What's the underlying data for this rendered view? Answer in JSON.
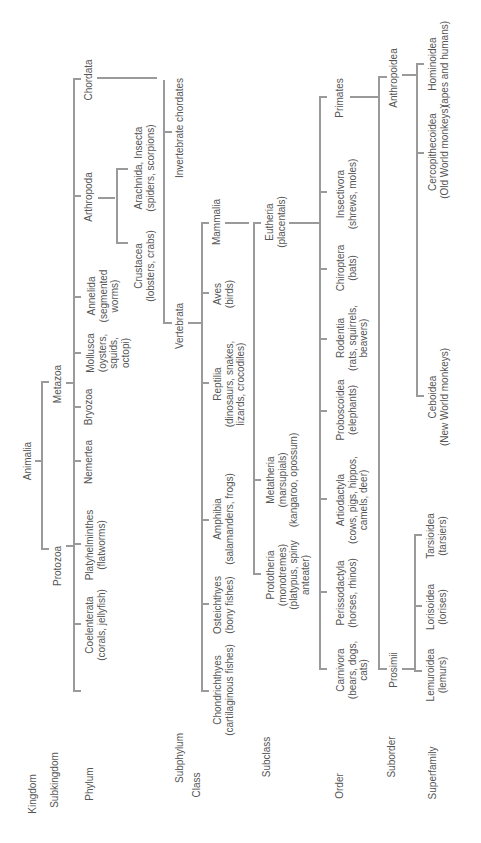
{
  "ranks": {
    "kingdom": "Kingdom",
    "subkingdom": "Subkingdom",
    "phylum": "Phylum",
    "subphylum": "Subphylum",
    "class": "Class",
    "subclass": "Subclass",
    "order": "Order",
    "suborder": "Suborder",
    "superfamily": "Superfamily"
  },
  "kingdom": {
    "name": "Animalia"
  },
  "subkingdoms": {
    "protozoa": "Protozoa",
    "metazoa": "Metazoa"
  },
  "phyla": {
    "coelenterata": {
      "name": "Coelenterata",
      "desc": "(corals, jellyfish)"
    },
    "platyhelminthes": {
      "name": "Platyhelminthes",
      "desc": "(flatworms)"
    },
    "nemertea": {
      "name": "Nemertea"
    },
    "bryozoa": {
      "name": "Bryozoa"
    },
    "mollusca": {
      "name": "Mollusca",
      "desc1": "(oysters,",
      "desc2": "squids,",
      "desc3": "octopi)"
    },
    "annelida": {
      "name": "Annelida",
      "desc1": "(segmented",
      "desc2": "worms)"
    },
    "arthropoda": {
      "name": "Arthropoda"
    },
    "chordata": {
      "name": "Chordata"
    }
  },
  "arthropod_groups": {
    "crustacea": {
      "name": "Crustacea",
      "desc": "(lobsters, crabs)"
    },
    "arachnida": {
      "name": "Arachnida, Insecta",
      "desc": "(spiders, scorpions)"
    }
  },
  "subphyla": {
    "vertebrata": "Vertebrata",
    "invertebrate_chordates": "Invertebrate chordates"
  },
  "classes": {
    "chondrichthyes": {
      "name": "Chondrichthyes",
      "desc": "(cartilaginous fishes)"
    },
    "osteichthyes": {
      "name": "Osteichthyes",
      "desc": "(bony fishes)"
    },
    "amphibia": {
      "name": "Amphibia",
      "desc": "(salamanders, frogs)"
    },
    "reptilia": {
      "name": "Reptilia",
      "desc1": "(dinosaurs, snakes,",
      "desc2": "lizards, crocodiles)"
    },
    "aves": {
      "name": "Aves",
      "desc": "(birds)"
    },
    "mammalia": {
      "name": "Mammalia"
    }
  },
  "subclasses": {
    "prototheria": {
      "name": "Prototheria",
      "desc1": "(monotremes)",
      "desc2": "(platypus, spiny",
      "desc3": "anteater)"
    },
    "metatheria": {
      "name": "Metatheria",
      "desc1": "(marsupials)",
      "desc2": "(kangaroo, opossum)"
    },
    "eutheria": {
      "name": "Eutheria",
      "desc": "(placentals)"
    }
  },
  "orders": {
    "carnivora": {
      "name": "Carnivora",
      "desc1": "(bears, dogs,",
      "desc2": "cats)"
    },
    "perissodactyla": {
      "name": "Perissodactyla",
      "desc": "(horses, rhinos)"
    },
    "artiodactyla": {
      "name": "Artiodactyla",
      "desc1": "(cows, pigs, hippos,",
      "desc2": "camels, deer)"
    },
    "proboscoidea": {
      "name": "Proboscoidea",
      "desc": "(elephants)"
    },
    "rodentia": {
      "name": "Rodentia",
      "desc1": "(rats, squirrels,",
      "desc2": "beavers)"
    },
    "chiroptera": {
      "name": "Chiroptera",
      "desc": "(bats)"
    },
    "insectivora": {
      "name": "Insectivora",
      "desc": "(shrews, moles)"
    },
    "primates": {
      "name": "Primates"
    }
  },
  "suborders": {
    "prosimii": "Prosimii",
    "anthropoidea": "Anthropoidea"
  },
  "superfamilies": {
    "lemuroidea": {
      "name": "Lemuroidea",
      "desc": "(lemurs)"
    },
    "lorisoidea": {
      "name": "Lorisoidea",
      "desc": "(lorises)"
    },
    "tarsioidea": {
      "name": "Tarsioidea",
      "desc": "(tarsiers)"
    },
    "ceboidea": {
      "name": "Ceboidea",
      "desc": "(New World monkeys)"
    },
    "cercopithecoidea": {
      "name": "Cercopithecoidea",
      "desc": "(Old World monkeys)"
    },
    "hominoidea": {
      "name": "Hominoidea",
      "desc": "(apes and humans)"
    }
  },
  "colors": {
    "line": "#9a9a9a",
    "text": "#555555",
    "background": "#ffffff"
  }
}
